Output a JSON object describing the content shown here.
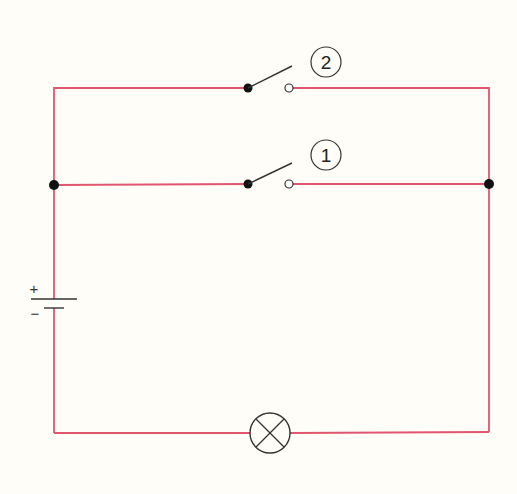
{
  "diagram": {
    "type": "electrical-circuit",
    "colors": {
      "background": "#fefdf8",
      "wire": "#e0566e",
      "component": "#333333",
      "junction": "#111111"
    },
    "switches": [
      {
        "id": "switch-2",
        "label": "2",
        "state": "open"
      },
      {
        "id": "switch-1",
        "label": "1",
        "state": "open"
      }
    ],
    "battery": {
      "plus_label": "+",
      "minus_label": "−"
    },
    "lamp": {
      "symbol": "crossed-circle"
    }
  }
}
